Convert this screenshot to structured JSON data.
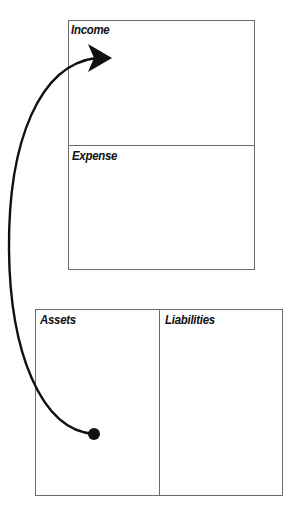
{
  "diagram": {
    "top_statement": {
      "sections": [
        {
          "id": "income",
          "label": "Income"
        },
        {
          "id": "expense",
          "label": "Expense"
        }
      ]
    },
    "bottom_statement": {
      "sections": [
        {
          "id": "assets",
          "label": "Assets"
        },
        {
          "id": "liabilities",
          "label": "Liabilities"
        }
      ]
    },
    "arrow": {
      "from": "assets",
      "to": "income",
      "color": "#111111"
    }
  }
}
